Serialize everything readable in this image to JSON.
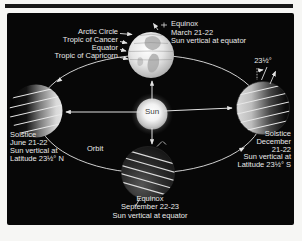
{
  "colors": {
    "panel_bg": "#070707",
    "text": "#e9e9e9",
    "line": "#e0e0e0",
    "page_bg": "#f6f6f4"
  },
  "diagram": {
    "sun_label": "Sun",
    "orbit_label": "Orbit",
    "tilt_angle": "23½°",
    "latitude_lines": [
      "Arctic Circle",
      "Tropic of Cancer",
      "Equator",
      "Tropic of Capricorn"
    ],
    "march": {
      "title": "Equinox",
      "date": "March 21-22",
      "detail": "Sun vertical at equator"
    },
    "june": {
      "title": "Solstice",
      "date": "June 21-22",
      "detail1": "Sun vertical at",
      "detail2": "Latitude 23½° N"
    },
    "september": {
      "title": "Equinox",
      "date": "September 22-23",
      "detail": "Sun vertical at equator"
    },
    "december": {
      "title": "Solstice",
      "date_line1": "December",
      "date_line2": "21-22",
      "detail1": "Sun vertical at",
      "detail2": "Latitude 23½° S"
    }
  }
}
